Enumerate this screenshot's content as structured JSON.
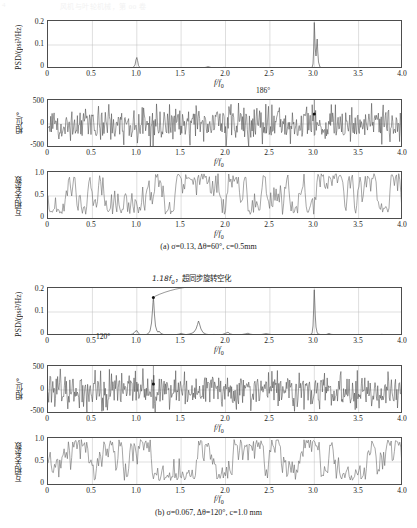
{
  "topstrip": {
    "left": "4",
    "center": "风机与叶轮机械，第 00 卷"
  },
  "figure": {
    "panel_a_caption": "(a) σ=0.13, Δθ=60°, c=0.5mm",
    "panel_b_caption": "(b) σ=0.067, Δθ=120°, c=1.0 mm"
  },
  "axes": {
    "psd_ylabel": "PSD/(psi²/Hz)",
    "phase_ylabel": "相位/°",
    "corr_ylabel": "互相关系数",
    "xlabel": "f/f",
    "xlabel_sub": "0",
    "psd_yticks": [
      "0.2",
      "0.1",
      "0"
    ],
    "phase_yticks": [
      "500",
      "0",
      "-500"
    ],
    "corr_yticks": [
      "1.0",
      "0.5",
      "0"
    ],
    "xticks": [
      "0",
      "0.5",
      "1.0",
      "1.5",
      "2.0",
      "2.5",
      "3.0",
      "3.5",
      "4.0"
    ]
  },
  "annotations": {
    "a_phase_marker": "186°",
    "b_psd_marker_value": "1.18",
    "b_psd_marker_sub": "0",
    "b_psd_marker_text": "，超同步旋转空化",
    "b_phase_marker": "120°"
  },
  "colors": {
    "trace": "#555555",
    "axis": "#4d4d4d",
    "grid": "#bdbdbd",
    "text": "#1a1a1a"
  },
  "chart_data": [
    {
      "type": "line",
      "id": "a-psd",
      "title": "",
      "xlabel": "f/f0",
      "ylabel": "PSD/(psi^2/Hz)",
      "xlim": [
        0,
        4
      ],
      "ylim": [
        0,
        0.22
      ],
      "grid": true,
      "peaks": [
        {
          "x": 1.0,
          "y": 0.042
        },
        {
          "x": 1.88,
          "y": 0.006
        },
        {
          "x": 2.0,
          "y": 0.004
        },
        {
          "x": 2.97,
          "y": 0.21
        },
        {
          "x": 3.02,
          "y": 0.09
        }
      ],
      "baseline": 0.002
    },
    {
      "type": "line",
      "id": "a-phase",
      "xlabel": "f/f0",
      "ylabel": "phase/deg",
      "xlim": [
        0,
        4
      ],
      "ylim": [
        -500,
        500
      ],
      "grid": true,
      "noise": "dense random phase, full-scale spikes",
      "marker": {
        "x": 3.0,
        "y": 186,
        "label": "186°"
      }
    },
    {
      "type": "line",
      "id": "a-corr",
      "xlabel": "f/f0",
      "ylabel": "cross-correlation coefficient",
      "xlim": [
        0,
        4
      ],
      "ylim": [
        0,
        1.05
      ],
      "grid": true,
      "noise": "oscillating 0.15-1.0, mean ~0.6"
    },
    {
      "type": "line",
      "id": "b-psd",
      "xlabel": "f/f0",
      "ylabel": "PSD/(psi^2/Hz)",
      "xlim": [
        0,
        4
      ],
      "ylim": [
        0,
        0.22
      ],
      "grid": true,
      "peaks": [
        {
          "x": 1.0,
          "y": 0.022
        },
        {
          "x": 1.18,
          "y": 0.135
        },
        {
          "x": 1.24,
          "y": 0.018
        },
        {
          "x": 1.55,
          "y": 0.012
        },
        {
          "x": 1.8,
          "y": 0.055
        },
        {
          "x": 2.0,
          "y": 0.018
        },
        {
          "x": 2.2,
          "y": 0.012
        },
        {
          "x": 2.38,
          "y": 0.012
        },
        {
          "x": 2.6,
          "y": 0.008
        },
        {
          "x": 3.0,
          "y": 0.2
        },
        {
          "x": 3.18,
          "y": 0.012
        },
        {
          "x": 3.8,
          "y": 0.006
        }
      ],
      "baseline": 0.003,
      "annotation": "1.18f0，超同步旋转空化"
    },
    {
      "type": "line",
      "id": "b-phase",
      "xlabel": "f/f0",
      "ylabel": "phase/deg",
      "xlim": [
        0,
        4
      ],
      "ylim": [
        -500,
        500
      ],
      "grid": true,
      "noise": "dense random phase, full-scale spikes",
      "marker": {
        "x": 1.18,
        "y": 120,
        "label": "120°"
      }
    },
    {
      "type": "line",
      "id": "b-corr",
      "xlabel": "f/f0",
      "ylabel": "cross-correlation coefficient",
      "xlim": [
        0,
        4
      ],
      "ylim": [
        0,
        1.05
      ],
      "grid": true,
      "noise": "oscillating 0.2-1.0, mean ~0.6"
    }
  ]
}
